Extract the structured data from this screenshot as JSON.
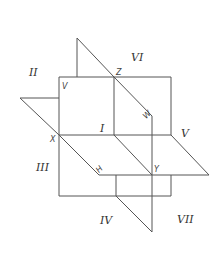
{
  "diagram": {
    "region_labels": {
      "r1": "I",
      "r2": "II",
      "r3": "III",
      "r4": "IV",
      "r5": "V",
      "r6": "VI",
      "r7": "VII"
    },
    "point_labels": {
      "v": "V",
      "z": "Z",
      "w": "W",
      "x": "X",
      "h": "H",
      "y": "Y"
    },
    "colors": {
      "line": "#555555",
      "text": "#333333",
      "background": "#ffffff"
    }
  }
}
